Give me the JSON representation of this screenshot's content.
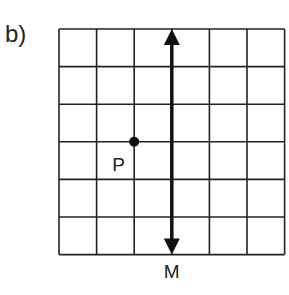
{
  "part_label": "b)",
  "grid": {
    "rows": 6,
    "cols": 6,
    "left": 59,
    "top": 29,
    "cell": 37.6,
    "line_color": "#222222"
  },
  "mirror_line": {
    "label": "M",
    "column_index": 3,
    "orientation": "vertical",
    "arrows": "both-ends"
  },
  "point": {
    "label": "P",
    "grid_x": 2,
    "grid_y": 3
  }
}
